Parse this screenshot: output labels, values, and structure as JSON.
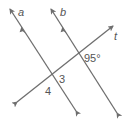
{
  "diagram": {
    "type": "parallel-lines-transversal",
    "lines": [
      {
        "name": "a",
        "label": "a",
        "role": "parallel",
        "has_parallel_marker": true
      },
      {
        "name": "b",
        "label": "b",
        "role": "parallel",
        "has_parallel_marker": true
      },
      {
        "name": "t",
        "label": "t",
        "role": "transversal"
      }
    ],
    "angles": [
      {
        "id": "given",
        "label": "95°",
        "at": "intersection of b and t",
        "position": "below-right of t, right of b"
      },
      {
        "id": "angle3",
        "label": "3",
        "at": "intersection of a and t",
        "position": "below t, right of a"
      },
      {
        "id": "angle4",
        "label": "4",
        "at": "intersection of a and t",
        "position": "below t, left of a"
      }
    ],
    "colors": {
      "line": "#6e6e6e",
      "text": "#555555",
      "background": "#ffffff"
    }
  }
}
